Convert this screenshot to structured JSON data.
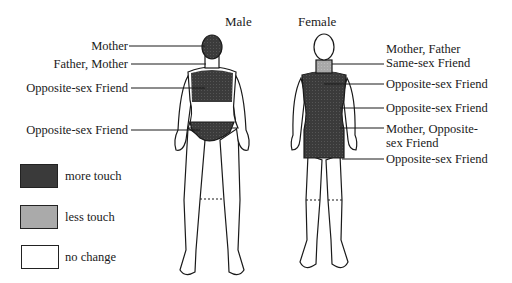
{
  "titles": {
    "male": "Male",
    "female": "Female"
  },
  "male_labels": [
    {
      "text": "Mother",
      "region": "head"
    },
    {
      "text": "Father, Mother",
      "region": "neck"
    },
    {
      "text": "Opposite-sex Friend",
      "region": "chest"
    },
    {
      "text": "Opposite-sex Friend",
      "region": "pelvis"
    }
  ],
  "female_labels": [
    {
      "line1": "Mother, Father",
      "line2": "Same-sex Friend",
      "region": "neck"
    },
    {
      "text": "Opposite-sex Friend",
      "region": "chest"
    },
    {
      "text": "Opposite-sex Friend",
      "region": "abdomen"
    },
    {
      "line1": "Mother, Opposite-",
      "line2": "sex Friend",
      "region": "hips"
    },
    {
      "text": "Opposite-sex Friend",
      "region": "thighs"
    }
  ],
  "legend": [
    {
      "label": "more touch",
      "color": "#3a3a3a"
    },
    {
      "label": "less touch",
      "color": "#aaaaaa"
    },
    {
      "label": "no change",
      "color": "#ffffff"
    }
  ]
}
